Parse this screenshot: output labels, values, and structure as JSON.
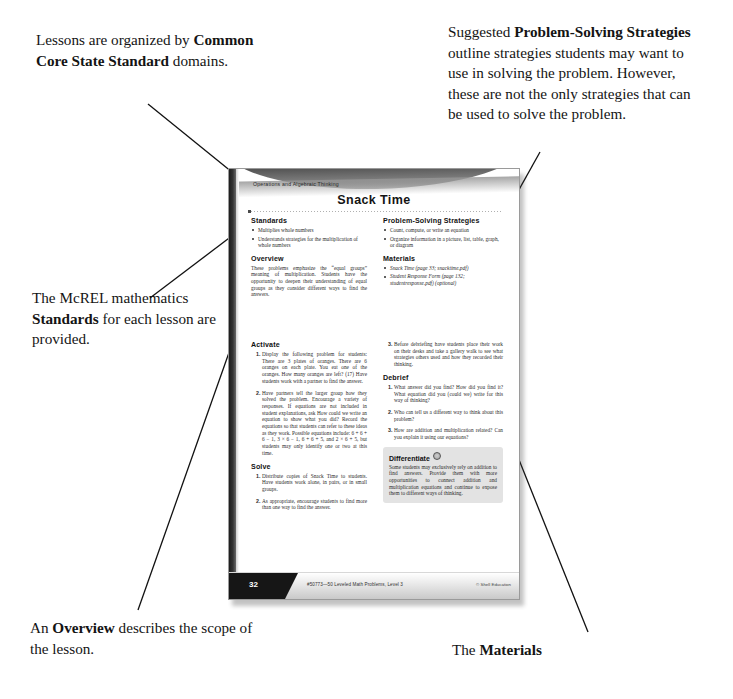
{
  "annotations": {
    "top_left": {
      "pre": "Lessons are organized by ",
      "bold": "Common Core State Standard",
      "post": " domains."
    },
    "top_right": {
      "pre": "Suggested ",
      "bold": "Problem-Solving Strategies",
      "post": " outline strategies students may want to use in solving the problem. However, these are not the only strategies that can be used to solve the problem."
    },
    "mid_left": {
      "pre": "The McREL mathematics ",
      "bold": "Standards",
      "post": " for each lesson are provided."
    },
    "bottom_left": {
      "pre": "An ",
      "bold": "Overview",
      "post": " describes the scope of the lesson."
    },
    "bottom_right": {
      "pre": "The ",
      "bold": "Materials",
      "post": " section lists the items needed for each lesson."
    }
  },
  "page": {
    "eyebrow": "Operations and Algebraic Thinking",
    "title": "Snack Time",
    "standards": {
      "heading": "Standards",
      "items": [
        "Multiplies whole numbers",
        "Understands strategies for the multiplication of whole numbers"
      ]
    },
    "overview": {
      "heading": "Overview",
      "text": "These problems emphasize the “equal groups” meaning of multiplication. Students have the opportunity to deepen their understanding of equal groups as they consider different ways to find the answers."
    },
    "strategies": {
      "heading": "Problem-Solving Strategies",
      "items": [
        "Count, compute, or write an equation",
        "Organize information in a picture, list, table, graph, or diagram"
      ]
    },
    "materials": {
      "heading": "Materials",
      "items": [
        "Snack Time (page 33; snacktime.pdf)",
        "Student Response Form (page 132; studentresponse.pdf) (optional)"
      ]
    },
    "activate": {
      "heading": "Activate",
      "steps": [
        "Display the following problem for students: There are 3 plates of oranges. There are 6 oranges on each plate. You eat one of the oranges. How many oranges are left? (17) Have students work with a partner to find the answer.",
        "Have partners tell the larger group how they solved the problem. Encourage a variety of responses. If equations are not included in student explanations, ask How could we write an equation to show what you did? Record the equations so that students can refer to these ideas as they work. Possible equations include: 6 + 6 + 6 − 1, 3 × 6 − 1, 6 + 6 + 5, and 2 × 6 + 5, but students may only identify one or two at this time.",
        "Before debriefing have students place their work on their desks and take a gallery walk to see what strategies others used and how they recorded their thinking."
      ]
    },
    "solve": {
      "heading": "Solve",
      "steps": [
        "Distribute copies of Snack Time to students. Have students work alone, in pairs, or in small groups.",
        "As appropriate, encourage students to find more than one way to find the answer."
      ]
    },
    "debrief": {
      "heading": "Debrief",
      "steps": [
        "What answer did you find? How did you find it? What equation did you (could we) write for this way of thinking?",
        "Who can tell us a different way to think about this problem?",
        "How are addition and multiplication related? Can you explain it using our equations?"
      ]
    },
    "differentiate": {
      "heading": "Differentiate",
      "icon": "circle-icon",
      "text": "Some students may exclusively rely on addition to find answers. Provide them with more opportunities to connect addition and multiplication equations and continue to expose them to different ways of thinking."
    },
    "footer": {
      "page_number": "32",
      "center": "#50773—50 Leveled Math Problems, Level 3",
      "right": "© Shell Education"
    }
  }
}
